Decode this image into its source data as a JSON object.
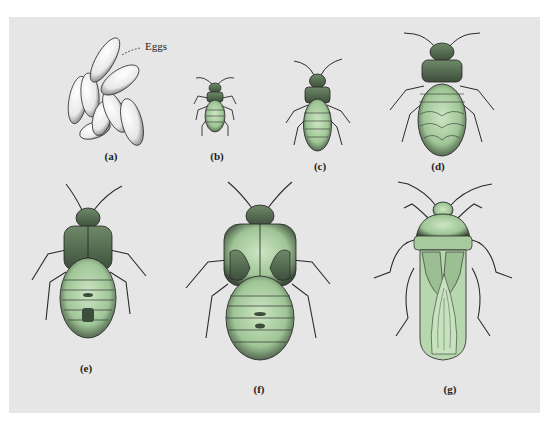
{
  "figure": {
    "background_color": "#e6e6e6",
    "insect_fill": "#b9d9b0",
    "insect_dark": "#4a5a48",
    "callout": {
      "text": "Eggs",
      "target": "a"
    },
    "panels": [
      {
        "id": "a",
        "label": "(a)",
        "subject": "eggs"
      },
      {
        "id": "b",
        "label": "(b)",
        "subject": "first instar nymph"
      },
      {
        "id": "c",
        "label": "(c)",
        "subject": "second instar nymph"
      },
      {
        "id": "d",
        "label": "(d)",
        "subject": "third instar nymph"
      },
      {
        "id": "e",
        "label": "(e)",
        "subject": "fourth instar nymph"
      },
      {
        "id": "f",
        "label": "(f)",
        "subject": "fifth instar nymph"
      },
      {
        "id": "g",
        "label": "(g)",
        "subject": "adult"
      }
    ]
  }
}
